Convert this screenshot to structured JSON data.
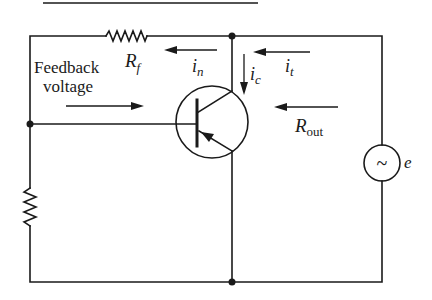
{
  "diagram": {
    "type": "circuit-schematic",
    "labels": {
      "feedback_line1": "Feedback",
      "feedback_line2": "voltage",
      "rf_main": "R",
      "rf_sub": "f",
      "in_main": "i",
      "in_sub": "n",
      "ic_main": "i",
      "ic_sub": "c",
      "it_main": "i",
      "it_sub": "t",
      "rout_main": "R",
      "rout_sub": "out",
      "source_symbol": "~",
      "source_label": "e"
    },
    "components": [
      {
        "id": "Rf",
        "kind": "resistor",
        "label": "Rf",
        "orientation": "horizontal"
      },
      {
        "id": "Rb",
        "kind": "resistor",
        "label": "",
        "orientation": "vertical"
      },
      {
        "id": "Q1",
        "kind": "transistor",
        "polarity": "PNP"
      },
      {
        "id": "e",
        "kind": "ac-voltage-source",
        "label": "e"
      }
    ],
    "arrows": [
      {
        "label": "in",
        "direction": "left"
      },
      {
        "label": "ic",
        "direction": "down"
      },
      {
        "label": "it",
        "direction": "left"
      },
      {
        "label": "Rout",
        "direction": "left"
      },
      {
        "label": "Feedback voltage",
        "direction": "right"
      }
    ],
    "colors": {
      "ink": "#1a1a1a",
      "background": "#ffffff"
    }
  }
}
